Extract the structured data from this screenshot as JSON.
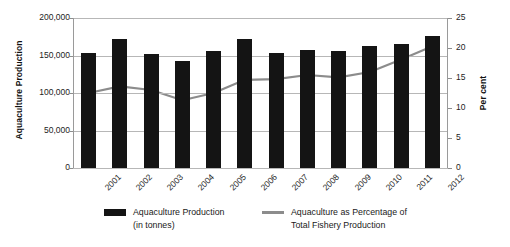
{
  "chart_data": {
    "type": "bar",
    "title": "",
    "xlabel": "",
    "ylabel": "Aquaculture Production",
    "y2label": "Per cent",
    "categories": [
      "2001",
      "2002",
      "2003",
      "2004",
      "2005",
      "2006",
      "2007",
      "2008",
      "2009",
      "2010",
      "2011",
      "2012"
    ],
    "ylim": [
      0,
      200000
    ],
    "y2lim": [
      0,
      25
    ],
    "yticks": [
      "0",
      "50,000",
      "100,000",
      "150,000",
      "200,000"
    ],
    "ytick_values": [
      0,
      50000,
      100000,
      150000,
      200000
    ],
    "y2ticks": [
      "0",
      "5",
      "10",
      "15",
      "20",
      "25"
    ],
    "y2tick_values": [
      0,
      5,
      10,
      15,
      20,
      25
    ],
    "grid": true,
    "legend_position": "bottom",
    "series": [
      {
        "name": "Aquaculture Production",
        "name_line2": "(in tonnes)",
        "type": "bar",
        "axis": "left",
        "color": "#141414",
        "values": [
          154000,
          172000,
          152000,
          143000,
          156000,
          172000,
          154000,
          158000,
          156000,
          163000,
          165000,
          176000
        ]
      },
      {
        "name": "Aquaculture as Percentage of",
        "name_line2": "Total Fishery Production",
        "type": "line",
        "axis": "right",
        "color": "#8c8c8c",
        "values": [
          12.5,
          13.6,
          13.0,
          11.3,
          12.5,
          14.7,
          14.8,
          15.5,
          15.1,
          16.0,
          18.1,
          20.3
        ]
      }
    ]
  },
  "legend": {
    "bars_line1": "Aquaculture Production",
    "bars_line2": "(in tonnes)",
    "line_line1": "Aquaculture as Percentage of",
    "line_line2": "Total Fishery Production"
  }
}
